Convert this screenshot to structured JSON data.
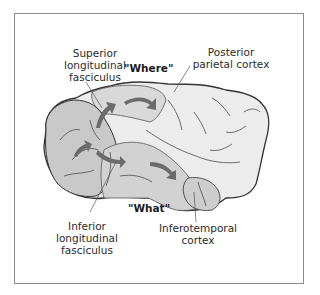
{
  "diagram": {
    "type": "anatomical-illustration",
    "colors": {
      "frame_border": "#8a8a8a",
      "brain_light": "#ececec",
      "brain_shaded": "#cfcfcf",
      "outline": "#333333",
      "arrow": "#666666",
      "text": "#2b2b2b"
    },
    "labels": {
      "superior": [
        "Superior",
        "longitudinal",
        "fasciculus"
      ],
      "posterior": [
        "Posterior",
        "parietal cortex"
      ],
      "inferior": [
        "Inferior",
        "longitudinal",
        "fasciculus"
      ],
      "inferotemporal": [
        "Inferotemporal",
        "cortex"
      ]
    },
    "streams": {
      "where": "\"Where\"",
      "what": "\"What\""
    }
  }
}
